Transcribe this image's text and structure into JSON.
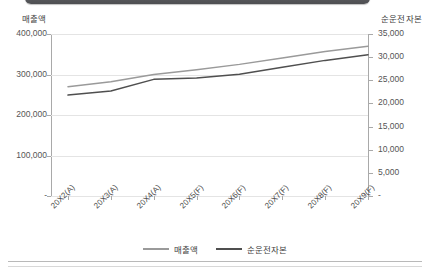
{
  "chart_data": {
    "type": "line",
    "title": "",
    "categories": [
      "20X2(A)",
      "20X3(A)",
      "20X4(A)",
      "20X5(F)",
      "20X6(F)",
      "20X7(F)",
      "20X8(F)",
      "20X9(F)"
    ],
    "xlabel": "",
    "grid": true,
    "legend_position": "bottom",
    "series": [
      {
        "name": "매출액",
        "axis": "left",
        "color": "#9a9a9a",
        "values": [
          270000,
          282000,
          300000,
          312000,
          325000,
          341000,
          357000,
          370000
        ]
      },
      {
        "name": "순운전자본",
        "axis": "right",
        "color": "#4f4f4f",
        "values": [
          21800,
          22700,
          25200,
          25500,
          26300,
          27800,
          29300,
          30500
        ]
      }
    ],
    "axes": {
      "left": {
        "title": "매출액",
        "ylim": [
          0,
          400000
        ],
        "ticks": [
          400000,
          300000,
          200000,
          100000,
          0
        ],
        "tick_labels": [
          "400,000",
          "300,000",
          "200,000",
          "100,000",
          "-"
        ]
      },
      "right": {
        "title": "순운전자본",
        "ylim": [
          0,
          35000
        ],
        "ticks": [
          35000,
          30000,
          25000,
          20000,
          15000,
          10000,
          5000,
          0
        ],
        "tick_labels": [
          "35,000",
          "30,000",
          "25,000",
          "20,000",
          "15,000",
          "10,000",
          "5,000",
          "-"
        ]
      }
    }
  },
  "legend": {
    "items": [
      {
        "label": "매출액",
        "color": "#9a9a9a"
      },
      {
        "label": "순운전자본",
        "color": "#4f4f4f"
      }
    ]
  }
}
